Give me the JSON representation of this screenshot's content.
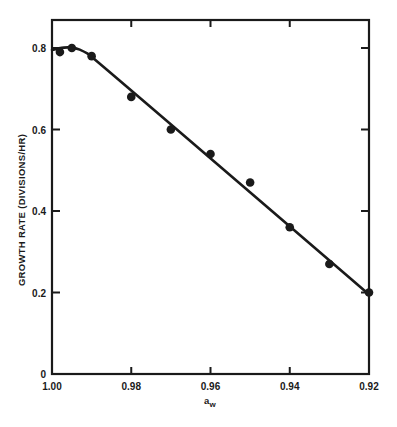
{
  "chart_data": {
    "type": "scatter",
    "title": "",
    "xlabel": "a_w",
    "xlabel_main": "a",
    "xlabel_sub": "w",
    "ylabel": "GROWTH RATE (DIVISIONS/HR)",
    "xlim": [
      1.0,
      0.92
    ],
    "ylim": [
      0,
      0.8
    ],
    "x_reversed": true,
    "grid": false,
    "legend": null,
    "x_ticks": [
      1.0,
      0.98,
      0.96,
      0.94,
      0.92
    ],
    "x_tick_labels": [
      "1.00",
      "0.98",
      "0.96",
      "0.94",
      "0.92"
    ],
    "y_ticks": [
      0,
      0.2,
      0.4,
      0.6,
      0.8
    ],
    "y_tick_labels": [
      "0",
      "0.2",
      "0.4",
      "0.6",
      "0.8"
    ],
    "series": [
      {
        "name": "observed",
        "type": "scatter",
        "x": [
          0.998,
          0.995,
          0.99,
          0.98,
          0.97,
          0.96,
          0.95,
          0.94,
          0.93,
          0.92
        ],
        "y": [
          0.79,
          0.8,
          0.78,
          0.68,
          0.6,
          0.54,
          0.47,
          0.36,
          0.27,
          0.2
        ]
      },
      {
        "name": "fitted curve",
        "type": "line",
        "x": [
          1.0,
          0.998,
          0.996,
          0.994,
          0.992,
          0.99,
          0.92
        ],
        "y": [
          0.795,
          0.8,
          0.802,
          0.8,
          0.792,
          0.78,
          0.195
        ]
      }
    ]
  }
}
